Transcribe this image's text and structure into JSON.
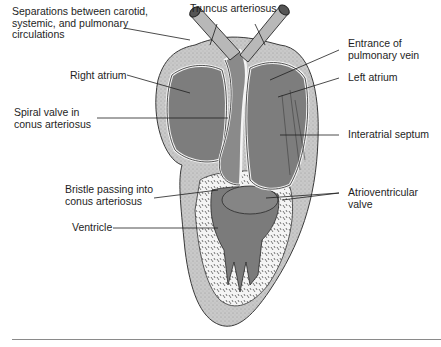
{
  "figure": {
    "labels": {
      "separations": "Separations between carotid,\nsystemic, and pulmonary\ncirculations",
      "truncus": "Truncus arteriosus",
      "pulmonary_vein": "Entrance of\npulmonary vein",
      "right_atrium": "Right atrium",
      "left_atrium": "Left atrium",
      "spiral_valve": "Spiral valve in\nconus arteriosus",
      "interatrial_septum": "Interatrial septum",
      "bristle": "Bristle passing into\nconus arteriosus",
      "av_valve": "Atrioventricular\nvalve",
      "ventricle": "Ventricle"
    },
    "colors": {
      "outer_wall": "#c8c8c8",
      "chamber": "#7d7d7d",
      "spongy": "#f2f2f2",
      "outline": "#2a2a2a",
      "rule": "#8a8a8a"
    }
  }
}
